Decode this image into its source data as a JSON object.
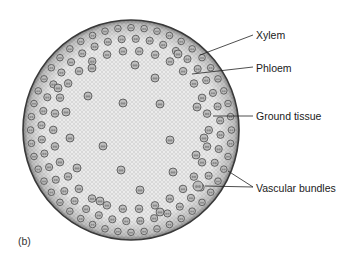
{
  "figure": {
    "panel_label": "(b)",
    "labels": [
      {
        "id": "xylem",
        "text": "Xylem",
        "x": 256,
        "y": 29
      },
      {
        "id": "phloem",
        "text": "Phloem",
        "x": 256,
        "y": 62
      },
      {
        "id": "ground-tissue",
        "text": "Ground tissue",
        "x": 256,
        "y": 110
      },
      {
        "id": "vascular-bundles",
        "text": "Vascular bundles",
        "x": 256,
        "y": 182
      }
    ],
    "leader_lines": [
      {
        "for": "xylem",
        "x1": 200,
        "y1": 55,
        "x2": 253,
        "y2": 35
      },
      {
        "for": "phloem",
        "x1": 192,
        "y1": 74,
        "x2": 253,
        "y2": 67
      },
      {
        "for": "ground-tissue",
        "x1": 213,
        "y1": 116,
        "x2": 253,
        "y2": 116
      },
      {
        "for": "vascular-bundles",
        "x1": 205,
        "y1": 186,
        "x2": 253,
        "y2": 187
      },
      {
        "for": "vascular-bundles",
        "x1": 228,
        "y1": 171,
        "x2": 253,
        "y2": 187
      }
    ],
    "stem": {
      "cx": 131,
      "cy": 130,
      "rx": 108,
      "ry": 110,
      "fill": "#ebebeb",
      "edge": "#3a3a3a"
    }
  }
}
